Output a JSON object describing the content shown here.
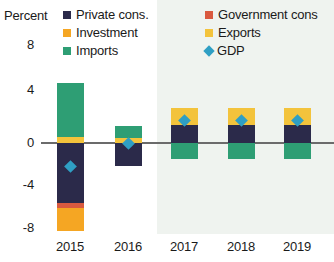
{
  "axis": {
    "y_title": "Percent",
    "y_ticks": [
      "8",
      "4",
      "0",
      "-4",
      "-8"
    ],
    "x_ticks": [
      "2015",
      "2016",
      "2017",
      "2018",
      "2019"
    ]
  },
  "legend": {
    "items": [
      {
        "label": "Private cons.",
        "key": "private_cons",
        "color": "#2b2a4a",
        "marker": "square"
      },
      {
        "label": "Investment",
        "key": "investment",
        "color": "#f5a623",
        "marker": "square"
      },
      {
        "label": "Imports",
        "key": "imports",
        "color": "#2e9e74",
        "marker": "square"
      },
      {
        "label": "Government cons",
        "key": "government_cons",
        "color": "#d9593f",
        "marker": "square"
      },
      {
        "label": "Exports",
        "key": "exports",
        "color": "#f3c33c",
        "marker": "square"
      },
      {
        "label": "GDP",
        "key": "gdp",
        "color": "#2f9fc4",
        "marker": "diamond"
      }
    ]
  },
  "colors": {
    "private_cons": "#2b2a4a",
    "investment": "#f5a623",
    "imports": "#2e9e74",
    "government_cons": "#d9593f",
    "exports": "#f3c33c",
    "gdp": "#2f9fc4",
    "forecast_band": "#e9efe9",
    "zero_line": "#6b6b6b",
    "text": "#1a1a1a"
  },
  "chart_data": {
    "type": "bar",
    "title": "",
    "subtitle": "",
    "xlabel": "",
    "ylabel": "Percent",
    "ylim": [
      -8,
      8
    ],
    "yticks": [
      -8,
      -4,
      0,
      4,
      8
    ],
    "grid": false,
    "stacked": true,
    "legend_position": "top",
    "categories": [
      "2015",
      "2016",
      "2017",
      "2018",
      "2019"
    ],
    "forecast_from": "2017",
    "annotations": [
      "Shaded area from 2017 onward denotes forecast period"
    ],
    "series": [
      {
        "name": "Private cons.",
        "key": "private_cons",
        "color": "#2b2a4a",
        "values": [
          -5.6,
          -2.2,
          1.7,
          1.7,
          1.7
        ]
      },
      {
        "name": "Investment",
        "key": "investment",
        "color": "#f5a623",
        "values": [
          -2.2,
          0.0,
          0.0,
          0.0,
          0.0
        ]
      },
      {
        "name": "Imports",
        "key": "imports",
        "color": "#2e9e74",
        "values": [
          5.0,
          1.1,
          -1.5,
          -1.5,
          -1.5
        ]
      },
      {
        "name": "Government cons",
        "key": "government_cons",
        "color": "#d9593f",
        "values": [
          -0.5,
          0.0,
          0.0,
          0.0,
          0.0
        ]
      },
      {
        "name": "Exports",
        "key": "exports",
        "color": "#f3c33c",
        "values": [
          0.6,
          0.5,
          1.6,
          1.6,
          1.6
        ]
      }
    ],
    "gdp": {
      "name": "GDP",
      "color": "#2f9fc4",
      "values": [
        -2.2,
        0.0,
        2.1,
        2.1,
        2.1
      ]
    }
  },
  "render": {
    "plot": {
      "left": 45,
      "right": 334,
      "top": 60,
      "bottom": 234
    },
    "zero_y": 143,
    "px_per_unit": 10.65,
    "bar_width": 27,
    "centers": [
      70,
      128,
      184,
      241,
      297
    ],
    "forecast_band": {
      "x": 157,
      "y": 0,
      "w": 177,
      "h": 234
    },
    "y_tick_y": [
      45,
      90,
      143,
      185,
      228
    ],
    "x_tick_y": 239,
    "stacks": [
      {
        "year": "2015",
        "pos": [
          {
            "key": "exports",
            "from": 0.0,
            "to": 0.6
          },
          {
            "key": "imports",
            "from": 0.6,
            "to": 5.6
          }
        ],
        "neg": [
          {
            "key": "private_cons",
            "from": 0.0,
            "to": -5.6
          },
          {
            "key": "government_cons",
            "from": -5.6,
            "to": -6.1
          },
          {
            "key": "investment",
            "from": -6.1,
            "to": -8.3
          }
        ],
        "gdp": -2.2
      },
      {
        "year": "2016",
        "pos": [
          {
            "key": "exports",
            "from": 0.0,
            "to": 0.5
          },
          {
            "key": "imports",
            "from": 0.5,
            "to": 1.6
          }
        ],
        "neg": [
          {
            "key": "private_cons",
            "from": 0.0,
            "to": -2.2
          }
        ],
        "gdp": 0.0
      },
      {
        "year": "2017",
        "pos": [
          {
            "key": "private_cons",
            "from": 0.0,
            "to": 1.7
          },
          {
            "key": "exports",
            "from": 1.7,
            "to": 3.3
          }
        ],
        "neg": [
          {
            "key": "imports",
            "from": 0.0,
            "to": -1.5
          }
        ],
        "gdp": 2.1
      },
      {
        "year": "2018",
        "pos": [
          {
            "key": "private_cons",
            "from": 0.0,
            "to": 1.7
          },
          {
            "key": "exports",
            "from": 1.7,
            "to": 3.3
          }
        ],
        "neg": [
          {
            "key": "imports",
            "from": 0.0,
            "to": -1.5
          }
        ],
        "gdp": 2.1
      },
      {
        "year": "2019",
        "pos": [
          {
            "key": "private_cons",
            "from": 0.0,
            "to": 1.7
          },
          {
            "key": "exports",
            "from": 1.7,
            "to": 3.3
          }
        ],
        "neg": [
          {
            "key": "imports",
            "from": 0.0,
            "to": -1.5
          }
        ],
        "gdp": 2.1
      }
    ],
    "legend_layout": {
      "col_x": [
        63,
        205
      ],
      "row_y": [
        8,
        26,
        44
      ],
      "pct_x": 4,
      "pct_y": 8
    }
  }
}
